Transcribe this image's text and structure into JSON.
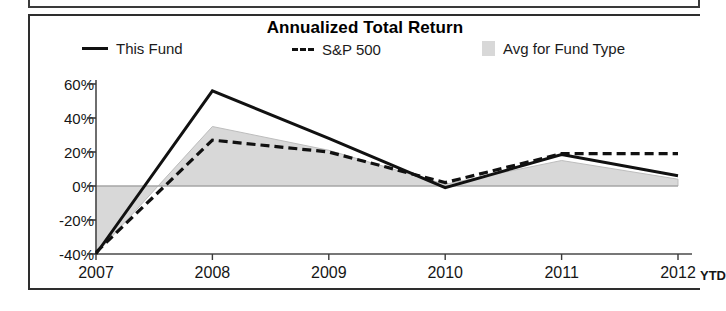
{
  "panel": {
    "title": "Annualized Total Return"
  },
  "legend": {
    "items": [
      {
        "label": "This Fund",
        "marker": "solid-line-swatch",
        "color": "#111111"
      },
      {
        "label": "S&P 500",
        "marker": "dashed-line-swatch",
        "color": "#111111"
      },
      {
        "label": "Avg for Fund Type",
        "marker": "gray-area-swatch",
        "color": "#d8d8d8"
      }
    ]
  },
  "axis": {
    "y_ticks": [
      "60%",
      "40%",
      "20%",
      "0%",
      "-20%",
      "-40%"
    ],
    "x_ticks": [
      "2007",
      "2008",
      "2009",
      "2010",
      "2011",
      "2012"
    ],
    "x_suffix": "YTD"
  },
  "chart_data": {
    "type": "line",
    "title": "Annualized Total Return",
    "xlabel": "",
    "ylabel": "",
    "categories": [
      "2007",
      "2008",
      "2009",
      "2010",
      "2011",
      "2012 YTD"
    ],
    "ylim": [
      -40,
      60
    ],
    "ytick_values": [
      60,
      40,
      20,
      0,
      -20,
      -40
    ],
    "ytick_labels": [
      "60%",
      "40%",
      "20%",
      "0%",
      "-20%",
      "-40%"
    ],
    "grid": false,
    "legend_position": "top",
    "zero_line": 0,
    "series": [
      {
        "name": "This Fund",
        "style": "solid",
        "color": "#111111",
        "values": [
          -40,
          56,
          28,
          -1,
          18.5,
          6
        ]
      },
      {
        "name": "S&P 500",
        "style": "dashed",
        "color": "#111111",
        "values": [
          -39,
          27,
          20,
          2,
          19,
          19
        ]
      },
      {
        "name": "Avg for Fund Type",
        "style": "filled-area",
        "color": "#d8d8d8",
        "values": [
          -40,
          35,
          21,
          1,
          15,
          4
        ]
      }
    ]
  }
}
